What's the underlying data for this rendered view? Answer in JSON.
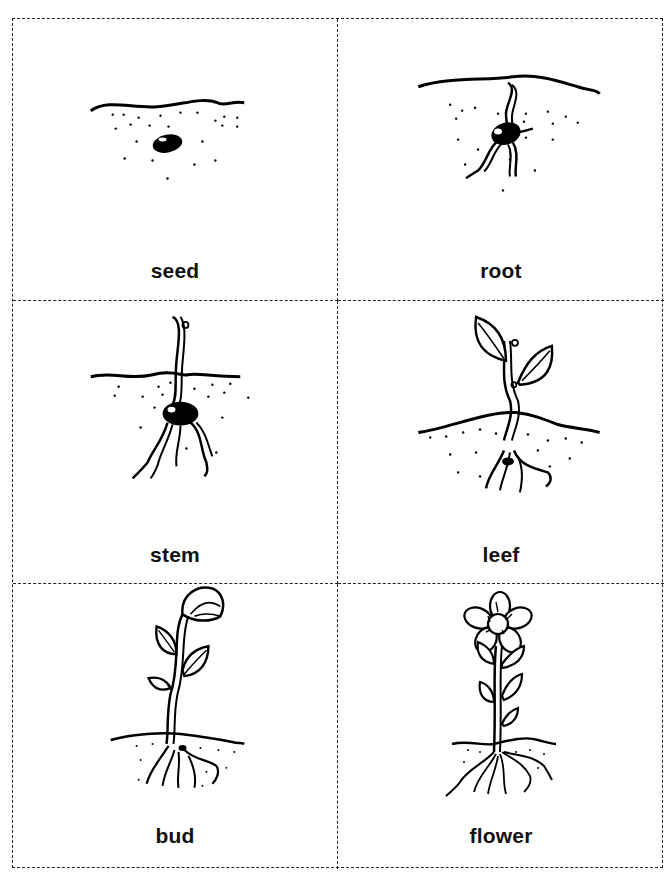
{
  "worksheet": {
    "cards": [
      {
        "label": "seed",
        "illustration": "seed-in-soil-icon"
      },
      {
        "label": "root",
        "illustration": "sprouting-root-icon"
      },
      {
        "label": "stem",
        "illustration": "stem-emerging-icon"
      },
      {
        "label": "leef",
        "illustration": "seedling-leaves-icon"
      },
      {
        "label": "bud",
        "illustration": "plant-bud-icon"
      },
      {
        "label": "flower",
        "illustration": "flowering-plant-icon"
      }
    ],
    "layout": {
      "columns": 2,
      "rows": 3,
      "border_style": "dashed",
      "border_color": "#222222"
    }
  }
}
